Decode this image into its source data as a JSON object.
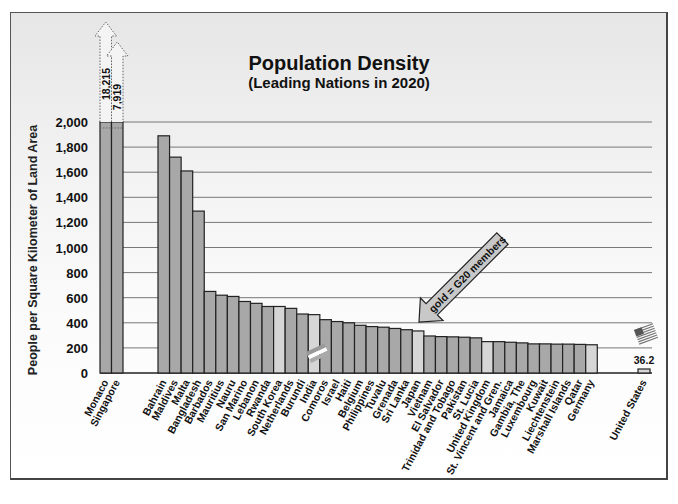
{
  "chart_data": {
    "type": "bar",
    "title": "Population Density",
    "subtitle": "(Leading Nations in 2020)",
    "xlabel": "",
    "ylabel": "People per Square Kilometer of Land Area",
    "ylim": [
      0,
      2000
    ],
    "yticks": [
      "0",
      "200",
      "400",
      "600",
      "800",
      "1,000",
      "1,200",
      "1,400",
      "1,600",
      "1,800",
      "2,000"
    ],
    "grid": true,
    "legend": null,
    "annotation": "gold = G20 members",
    "colors": {
      "normal": "#a8a8a8",
      "g20": "#d6d6d6",
      "outline": "#222222"
    },
    "categories": [
      "Monaco",
      "Singapore",
      "Bahrain",
      "Maldives",
      "Malta",
      "Bangladesh",
      "Barbados",
      "Mauritius",
      "Nauru",
      "San Marino",
      "Lebanon",
      "Rwanda",
      "South Korea",
      "Netherlands",
      "Burundi",
      "India",
      "Comoros",
      "Israel",
      "Haiti",
      "Belgium",
      "Philippines",
      "Tuvalu",
      "Grenada",
      "Sri Lanka",
      "Japan",
      "Vietnam",
      "El Salvador",
      "Trinidad and Tobago",
      "Pakistan",
      "St. Lucia",
      "United Kingdom",
      "St. Vincent and Gren.",
      "Jamaica",
      "Gambia, The",
      "Luxembourg",
      "Kuwait",
      "Liechtenstein",
      "Marshall Islands",
      "Qatar",
      "Germany",
      "United States"
    ],
    "values": [
      18215,
      7919,
      1890,
      1720,
      1610,
      1290,
      650,
      620,
      610,
      570,
      555,
      530,
      530,
      515,
      470,
      465,
      425,
      410,
      400,
      380,
      370,
      365,
      355,
      345,
      335,
      295,
      290,
      288,
      285,
      280,
      250,
      250,
      245,
      240,
      232,
      232,
      230,
      230,
      228,
      225,
      36.2
    ],
    "g20": [
      false,
      false,
      false,
      false,
      false,
      false,
      false,
      false,
      false,
      false,
      false,
      false,
      true,
      false,
      false,
      true,
      false,
      false,
      false,
      false,
      false,
      false,
      false,
      false,
      true,
      false,
      false,
      false,
      false,
      false,
      true,
      false,
      false,
      false,
      false,
      false,
      false,
      false,
      false,
      true,
      true
    ],
    "overflow_labels": {
      "Monaco": "18,215",
      "Singapore": "7,919"
    },
    "value_label_us": "36.2"
  }
}
